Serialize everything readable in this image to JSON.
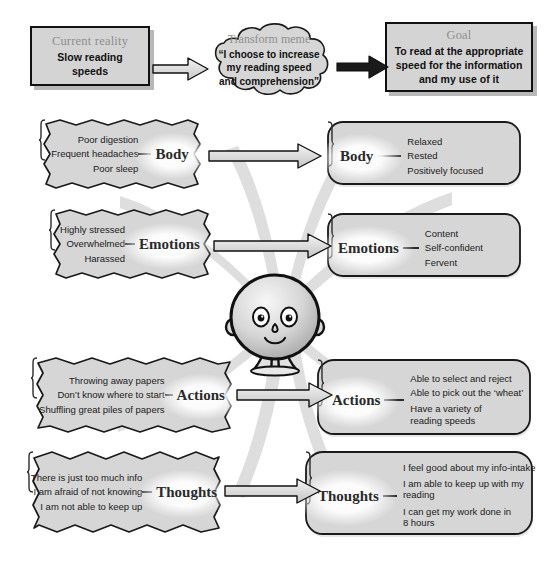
{
  "diagram": {
    "colors": {
      "box_fill": "#d4d4d4",
      "box_stroke": "#111111",
      "caption_gray": "#8e8e8e",
      "arrow_fill": "#d9d9d9",
      "swoosh_gray": "#dcdcdc",
      "background": "#ffffff"
    }
  },
  "top_row": {
    "current_reality": {
      "caption": "Current reality",
      "text": "Slow reading speeds"
    },
    "transform_meme": {
      "caption": "Transform meme",
      "text": "“I choose to increase my reading speed and comprehension”"
    },
    "goal": {
      "caption": "Goal",
      "text": "To read at the appropriate speed for the information and my use of it"
    }
  },
  "rows": [
    {
      "key": "body",
      "label": "Body",
      "before": [
        "Poor digestion",
        "Frequent headaches",
        "Poor sleep"
      ],
      "after": [
        "Relaxed",
        "Rested",
        "Positively focused"
      ]
    },
    {
      "key": "emotions",
      "label": "Emotions",
      "before": [
        "Highly stressed",
        "Overwhelmed",
        "Harassed"
      ],
      "after": [
        "Content",
        "Self-confident",
        "Fervent"
      ]
    },
    {
      "key": "actions",
      "label": "Actions",
      "before": [
        "Throwing away papers",
        "Don’t know where to start",
        "Shuffling great piles of papers"
      ],
      "after": [
        "Able to select and reject",
        "Able to pick out the ‘wheat’",
        "Have a variety of\nreading speeds"
      ]
    },
    {
      "key": "thoughts",
      "label": "Thoughts",
      "before": [
        "There is just too much info",
        "I am afraid of not knowing",
        "I am not able to keep up"
      ],
      "after": [
        "I feel good about my info-intake",
        "I am able to keep up with my\nreading",
        "I can get my work done in\n8 hours"
      ]
    }
  ],
  "figure": {
    "name": "central-character"
  }
}
